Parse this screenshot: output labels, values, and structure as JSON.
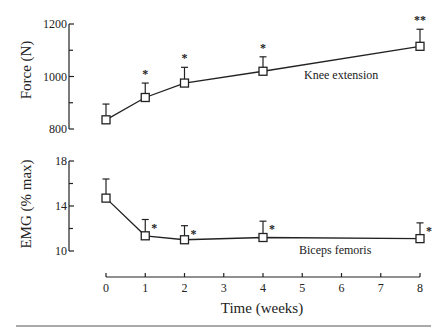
{
  "chart_data": [
    {
      "type": "line",
      "panel": "top",
      "ylabel": "Force (N)",
      "xlabel": "Time (weeks)",
      "ylim": [
        800,
        1200
      ],
      "yticks_major": [
        800,
        1000,
        1200
      ],
      "yticks_minor": [
        900,
        1100
      ],
      "x": [
        0,
        1,
        2,
        4,
        8
      ],
      "series": [
        {
          "name": "Knee extension",
          "values": [
            835,
            920,
            975,
            1020,
            1115
          ],
          "error_upper": [
            60,
            55,
            60,
            55,
            65
          ],
          "significance": [
            "",
            "*",
            "*",
            "*",
            "**"
          ]
        }
      ],
      "annotations": [
        {
          "text": "Knee extension",
          "x": 5.0,
          "y": 990
        }
      ],
      "grid": false,
      "legend": "none"
    },
    {
      "type": "line",
      "panel": "bottom",
      "ylabel": "EMG (% max)",
      "xlabel": "Time (weeks)",
      "ylim": [
        10,
        18
      ],
      "yticks_major": [
        10,
        14,
        18
      ],
      "yticks_minor": [
        12,
        16
      ],
      "x": [
        0,
        1,
        2,
        4,
        8
      ],
      "series": [
        {
          "name": "Biceps femoris",
          "values": [
            14.7,
            11.35,
            11.0,
            11.2,
            11.1
          ],
          "error_upper": [
            1.7,
            1.45,
            1.25,
            1.45,
            1.4
          ],
          "significance": [
            "",
            "*",
            "*",
            "*",
            "*"
          ]
        }
      ],
      "annotations": [
        {
          "text": "Biceps femoris",
          "x": 5.0,
          "y": 10.0
        }
      ],
      "grid": false,
      "legend": "none"
    }
  ],
  "x_axis": {
    "title": "Time (weeks)",
    "ticks": [
      0,
      1,
      2,
      3,
      4,
      5,
      6,
      7,
      8
    ],
    "range": [
      0,
      8
    ]
  },
  "icons": {
    "marker": "open-square-marker",
    "significance": "asterisk"
  },
  "colors": {
    "ink": "#222222",
    "background": "#ffffff"
  }
}
